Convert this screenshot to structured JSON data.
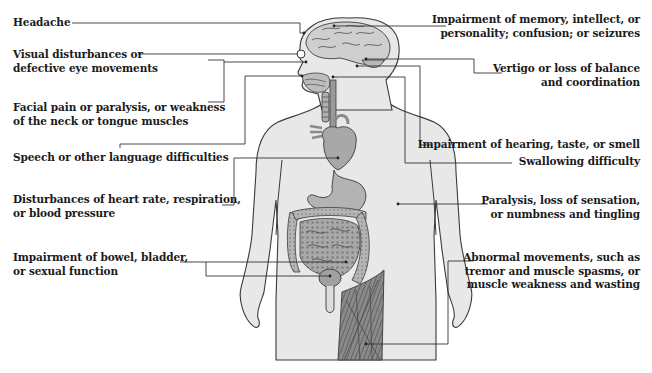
{
  "diagram": {
    "colors": {
      "background": "#ffffff",
      "text": "#1a1a1a",
      "leader_line": "#333333",
      "skin_fill": "#e6e6e6",
      "outline": "#3a3a3a",
      "organ_fill": "#b8b8b8",
      "organ_dark": "#8a8a8a",
      "muscle_fill": "#7a7a7a"
    },
    "left_labels": [
      {
        "id": "headache",
        "lines": [
          "Headache"
        ],
        "target": "head / forehead"
      },
      {
        "id": "visual",
        "lines": [
          "Visual disturbances or",
          "defective eye movements"
        ],
        "target": "eye"
      },
      {
        "id": "facial",
        "lines": [
          "Facial pain or paralysis, or weakness",
          "of the neck or tongue muscles"
        ],
        "target": "face / cheek"
      },
      {
        "id": "speech",
        "lines": [
          "Speech or other language difficulties"
        ],
        "target": "mouth / lips"
      },
      {
        "id": "heart",
        "lines": [
          "Disturbances of heart rate, respiration,",
          "or blood pressure"
        ],
        "target": "heart"
      },
      {
        "id": "bowel",
        "lines": [
          "Impairment of bowel, bladder,",
          "or sexual function"
        ],
        "target": "intestines and bladder"
      }
    ],
    "right_labels": [
      {
        "id": "memory",
        "lines": [
          "Impairment of memory, intellect, or",
          "personality; confusion; or seizures"
        ],
        "target": "brain"
      },
      {
        "id": "vertigo",
        "lines": [
          "Vertigo or loss of balance",
          "and coordination"
        ],
        "target": "cerebellum / inner ear"
      },
      {
        "id": "hearing",
        "lines": [
          "Impairment of hearing, taste, or smell"
        ],
        "target": "ear / nose"
      },
      {
        "id": "swallowing",
        "lines": [
          "Swallowing difficulty"
        ],
        "target": "throat / pharynx"
      },
      {
        "id": "paralysis",
        "lines": [
          "Paralysis, loss of sensation,",
          "or numbness and tingling"
        ],
        "target": "arm"
      },
      {
        "id": "movement",
        "lines": [
          "Abnormal movements, such as",
          "tremor and muscle spasms, or",
          "muscle weakness and wasting"
        ],
        "target": "thigh muscles"
      }
    ]
  }
}
